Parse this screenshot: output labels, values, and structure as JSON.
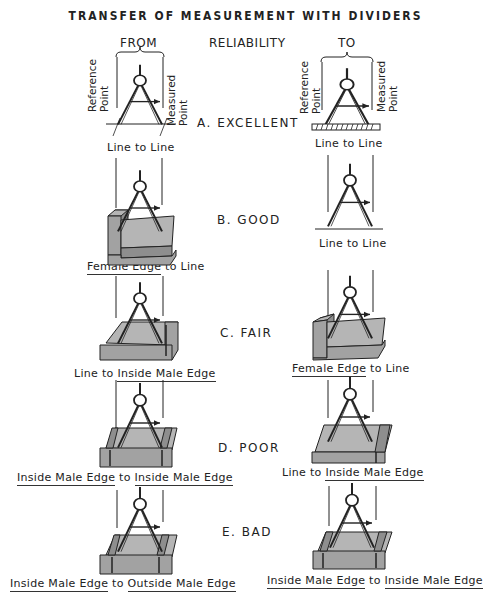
{
  "title": "TRANSFER OF MEASUREMENT WITH DIVIDERS",
  "headers": {
    "from": "FROM",
    "reliability": "RELIABILITY",
    "to": "TO"
  },
  "labels": {
    "reference_point": [
      "Reference",
      "Point"
    ],
    "measured_point": [
      "Measured",
      "Point"
    ]
  },
  "colors": {
    "block_face": "#b5b5b5",
    "block_side": "#8e8e8e",
    "ink": "#222222"
  },
  "rows": [
    {
      "rating": "A.  EXCELLENT",
      "from": {
        "parts": [
          {
            "text": "Line to Line",
            "underline": false
          }
        ]
      },
      "to": {
        "parts": [
          {
            "text": "Line to Line",
            "underline": false
          }
        ]
      }
    },
    {
      "rating": "B.  GOOD",
      "from": {
        "parts": [
          {
            "text": "Female Edge",
            "underline": true
          },
          {
            "text": " to Line",
            "underline": false
          }
        ]
      },
      "to": {
        "parts": [
          {
            "text": "Line to Line",
            "underline": false
          }
        ]
      }
    },
    {
      "rating": "C.  FAIR",
      "from": {
        "parts": [
          {
            "text": "Line to ",
            "underline": false
          },
          {
            "text": "Inside Male Edge",
            "underline": true
          }
        ]
      },
      "to": {
        "parts": [
          {
            "text": "Female Edge",
            "underline": true
          },
          {
            "text": " to Line",
            "underline": false
          }
        ]
      }
    },
    {
      "rating": "D.  POOR",
      "from": {
        "parts": [
          {
            "text": "Inside Male Edge",
            "underline": true
          },
          {
            "text": " to ",
            "underline": false
          },
          {
            "text": "Inside Male Edge",
            "underline": true
          }
        ]
      },
      "to": {
        "parts": [
          {
            "text": "Line to ",
            "underline": false
          },
          {
            "text": "Inside Male Edge",
            "underline": true
          }
        ]
      }
    },
    {
      "rating": "E.  BAD",
      "from": {
        "parts": [
          {
            "text": "Inside Male Edge",
            "underline": true
          },
          {
            "text": " to ",
            "underline": false
          },
          {
            "text": "Outside Male Edge",
            "underline": true
          }
        ]
      },
      "to": {
        "parts": [
          {
            "text": "Inside Male Edge",
            "underline": true
          },
          {
            "text": " to ",
            "underline": false
          },
          {
            "text": "Inside Male Edge",
            "underline": true
          }
        ]
      }
    }
  ]
}
